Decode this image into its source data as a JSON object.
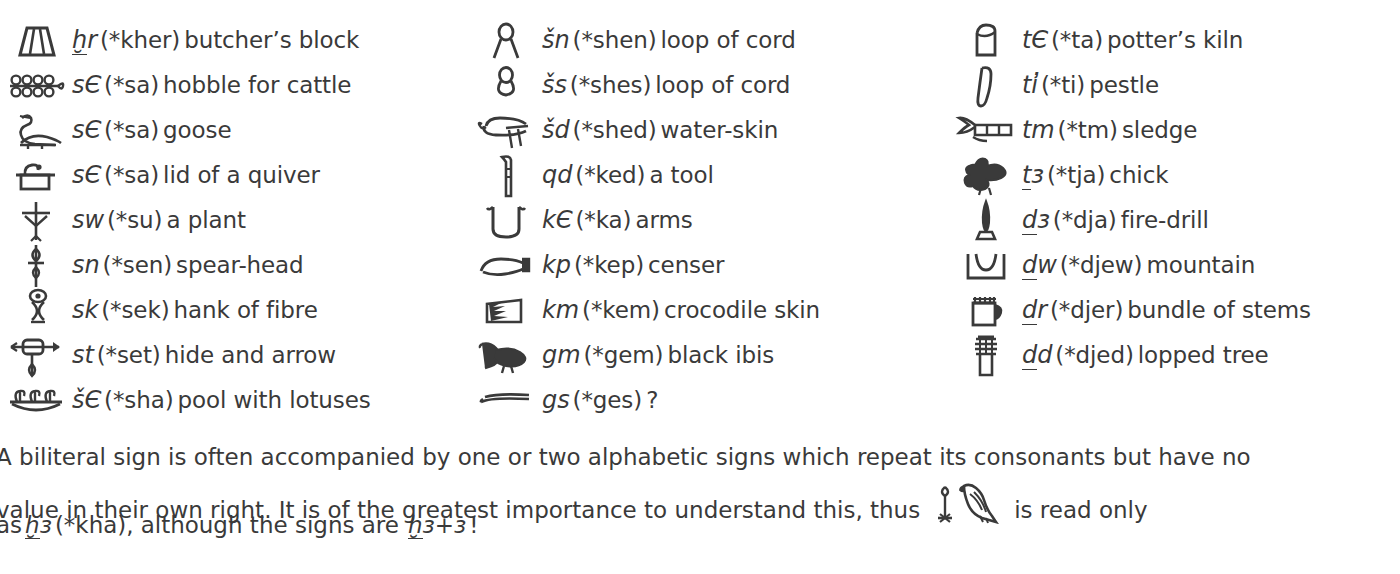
{
  "page": {
    "ink_color": "#3a3a3a",
    "background_color": "#ffffff"
  },
  "columns": [
    {
      "id": "column-1",
      "rows": [
        {
          "glyph": "butchers-block-glyph",
          "translit": "ẖr",
          "translit_underdot": "h",
          "phonetic": "(*kher)",
          "meaning": "butcher’s block"
        },
        {
          "glyph": "hobble-for-cattle-glyph",
          "translit": "sЄ",
          "translit_underdot": "",
          "phonetic": "(*sa)",
          "meaning": "hobble for cattle"
        },
        {
          "glyph": "goose-glyph",
          "translit": "sЄ",
          "translit_underdot": "",
          "phonetic": "(*sa)",
          "meaning": "goose"
        },
        {
          "glyph": "lid-of-quiver-glyph",
          "translit": "sЄ",
          "translit_underdot": "",
          "phonetic": "(*sa)",
          "meaning": "lid of a quiver"
        },
        {
          "glyph": "plant-glyph",
          "translit": "sw",
          "translit_underdot": "",
          "phonetic": "(*su)",
          "meaning": "a plant"
        },
        {
          "glyph": "spear-head-glyph",
          "translit": "sn",
          "translit_underdot": "",
          "phonetic": "(*sen)",
          "meaning": "spear-head"
        },
        {
          "glyph": "hank-of-fibre-glyph",
          "translit": "sk",
          "translit_underdot": "",
          "phonetic": "(*sek)",
          "meaning": "hank of fibre"
        },
        {
          "glyph": "hide-and-arrow-glyph",
          "translit": "st",
          "translit_underdot": "",
          "phonetic": "(*set)",
          "meaning": "hide and arrow"
        },
        {
          "glyph": "pool-with-lotuses-glyph",
          "translit": "šЄ",
          "translit_underdot": "",
          "phonetic": "(*sha)",
          "meaning": "pool with lotuses"
        }
      ]
    },
    {
      "id": "column-2",
      "rows": [
        {
          "glyph": "loop-of-cord-shen-glyph",
          "translit": "šn",
          "translit_underdot": "",
          "phonetic": "(*shen)",
          "meaning": "loop of cord"
        },
        {
          "glyph": "loop-of-cord-shes-glyph",
          "translit": "šs",
          "translit_underdot": "",
          "phonetic": "(*shes)",
          "meaning": "loop of cord"
        },
        {
          "glyph": "water-skin-glyph",
          "translit": "šd",
          "translit_underdot": "",
          "phonetic": "(*shed)",
          "meaning": "water-skin"
        },
        {
          "glyph": "a-tool-glyph",
          "translit": "qd",
          "translit_underdot": "",
          "phonetic": "(*ked)",
          "meaning": "a tool"
        },
        {
          "glyph": "arms-glyph",
          "translit": "kЄ",
          "translit_underdot": "",
          "phonetic": "(*ka)",
          "meaning": "arms"
        },
        {
          "glyph": "censer-glyph",
          "translit": "kp",
          "translit_underdot": "",
          "phonetic": "(*kep)",
          "meaning": "censer"
        },
        {
          "glyph": "crocodile-skin-glyph",
          "translit": "km",
          "translit_underdot": "",
          "phonetic": "(*kem)",
          "meaning": "crocodile  skin"
        },
        {
          "glyph": "black-ibis-glyph",
          "translit": "gm",
          "translit_underdot": "",
          "phonetic": "(*gem)",
          "meaning": "black ibis"
        },
        {
          "glyph": "gs-sign-glyph",
          "translit": "gs",
          "translit_underdot": "",
          "phonetic": "(*ges)",
          "meaning": "?"
        }
      ]
    },
    {
      "id": "column-3",
      "rows": [
        {
          "glyph": "potters-kiln-glyph",
          "translit": "tЄ",
          "translit_underdot": "",
          "phonetic": "(*ta)",
          "meaning": "potter’s kiln"
        },
        {
          "glyph": "pestle-glyph",
          "translit": "ti̓",
          "translit_underdot": "",
          "phonetic": "(*ti)",
          "meaning": "pestle"
        },
        {
          "glyph": "sledge-glyph",
          "translit": "tm",
          "translit_underdot": "",
          "phonetic": "(*tm)",
          "meaning": "sledge"
        },
        {
          "glyph": "chick-glyph",
          "translit": "tЄ",
          "translit_underdot": "t",
          "phonetic": "(*tja)",
          "meaning": "chick"
        },
        {
          "glyph": "fire-drill-glyph",
          "translit": "dЄ",
          "translit_underdot": "d",
          "phonetic": "(*dja)",
          "meaning": "fire-drill"
        },
        {
          "glyph": "mountain-glyph",
          "translit": "dw",
          "translit_underdot": "d",
          "phonetic": "(*djew)",
          "meaning": "mountain"
        },
        {
          "glyph": "bundle-of-stems-glyph",
          "translit": "dr",
          "translit_underdot": "d",
          "phonetic": "(*djer)",
          "meaning": "bundle of stems"
        },
        {
          "glyph": "lopped-tree-glyph",
          "translit": "dd",
          "translit_underdot": "d",
          "phonetic": "(*djed)",
          "meaning": "lopped tree"
        }
      ]
    }
  ],
  "note": {
    "line1": "A biliteral sign is often accompanied by one or two alphabetic signs which repeat its consonants but have no",
    "line2_before": "value in their own right.  It is of the greatest importance to understand this, thus",
    "line2_after": "is read only",
    "line3_before": "as",
    "line3_translit": "ẖЄ",
    "line3_phonetic": "(*kha),",
    "line3_middle": "although the signs are",
    "line3_formula": "ẖЄ+Є",
    "line3_end": "!"
  }
}
